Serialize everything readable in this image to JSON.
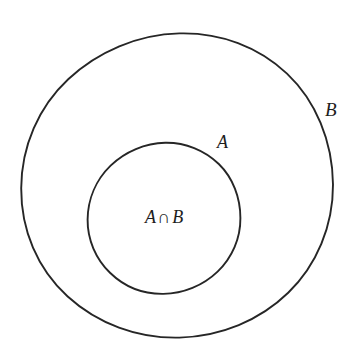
{
  "figure": {
    "type": "set-diagram",
    "background_color": "#ffffff",
    "stroke_color": "#262626",
    "stroke_width_px": 1.9,
    "width_px": 359,
    "height_px": 359
  },
  "sets": {
    "outer": {
      "label": "B",
      "name": "set-b",
      "center_x": 177,
      "center_y": 183,
      "radius": 156
    },
    "inner": {
      "label": "A",
      "name": "set-a",
      "center_x": 165,
      "center_y": 217,
      "radius": 75
    }
  },
  "labels": {
    "outer_label": "B",
    "inner_label": "A",
    "intersection": {
      "left_operand": "A",
      "operator": "∩",
      "right_operand": "B",
      "full_text": "A ∩ B"
    }
  }
}
